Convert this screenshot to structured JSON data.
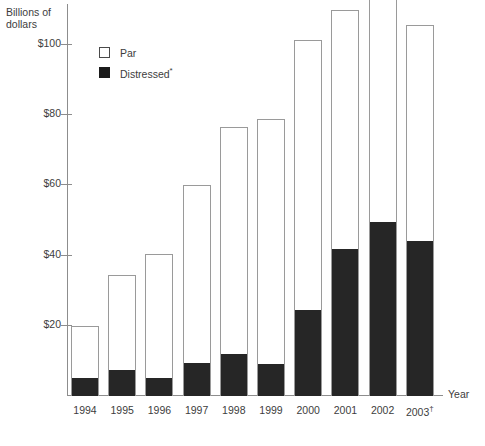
{
  "chart_data": {
    "type": "bar",
    "title": "",
    "subtitle": "",
    "ylabel": "Billions of\ndollars",
    "xlabel": "Year",
    "categories": [
      "1994",
      "1995",
      "1996",
      "1997",
      "1998",
      "1999",
      "2000",
      "2001",
      "2002",
      "2003"
    ],
    "category_notes": [
      "",
      "",
      "",
      "",
      "",
      "",
      "",
      "",
      "",
      "†"
    ],
    "stacked": true,
    "series": [
      {
        "name": "Distressed*",
        "color": "#262626",
        "values": [
          5,
          7.5,
          5,
          9.5,
          12,
          9,
          24.5,
          42,
          49.5,
          44
        ]
      },
      {
        "name": "Par",
        "color": "#ffffff",
        "values": [
          15,
          27,
          35.5,
          50.5,
          64.5,
          70,
          77,
          68,
          65,
          61.5
        ]
      }
    ],
    "totals": [
      20,
      34.5,
      40.5,
      60,
      76.5,
      79,
      101.5,
      110,
      114.5,
      105.5
    ],
    "ytick_labels": [
      "$20",
      "$40",
      "$60",
      "$80",
      "$100"
    ],
    "ytick_values": [
      20,
      40,
      60,
      80,
      100
    ],
    "ylim": [
      0,
      118
    ],
    "grid": false,
    "legend_position": "top-left-inside",
    "legend": [
      {
        "label": "Par",
        "note": "",
        "swatch": "open-square"
      },
      {
        "label": "Distressed",
        "note": "*",
        "swatch": "filled-square"
      }
    ]
  },
  "axes": {
    "y_title": "Billions of\ndollars",
    "x_title": "Year"
  },
  "colors": {
    "bar_outline": "#9a9a9a",
    "distressed_fill": "#262626",
    "par_fill": "#ffffff",
    "axis": "#8d8d8d",
    "text": "#3d3d3d",
    "background": "#ffffff"
  }
}
